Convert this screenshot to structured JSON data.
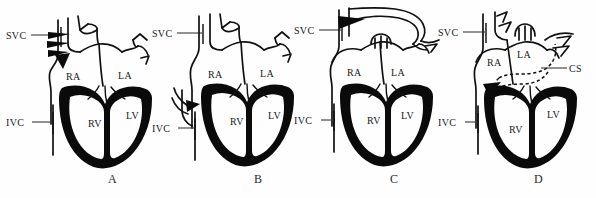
{
  "figure": {
    "type": "medical-illustration",
    "background_color": "#fefefe",
    "ink_color": "#111111",
    "panel_count": 4
  },
  "panels": [
    {
      "id": "A",
      "letter": "A",
      "labels": {
        "svc": "SVC",
        "ivc": "IVC",
        "ra": "RA",
        "la": "LA",
        "rv": "RV",
        "lv": "LV"
      },
      "features": [
        "descending-chevron-arrows-on-svc",
        "retrograde-flow-indicators"
      ]
    },
    {
      "id": "B",
      "letter": "B",
      "labels": {
        "svc": "SVC",
        "ivc": "IVC",
        "ra": "RA",
        "la": "LA",
        "rv": "RV",
        "lv": "LV"
      },
      "features": [
        "hepatic-vein-branch-arrow-into-ra",
        "ivc-junction-arrow"
      ]
    },
    {
      "id": "C",
      "letter": "C",
      "labels": {
        "svc": "SVC",
        "ivc": "IVC",
        "ra": "RA",
        "la": "LA",
        "rv": "RV",
        "lv": "LV"
      },
      "features": [
        "anomalous-arching-vessel-over-heart",
        "arrow-entering-svc-from-arch"
      ]
    },
    {
      "id": "D",
      "letter": "D",
      "labels": {
        "svc": "SVC",
        "ivc": "IVC",
        "ra": "RA",
        "la": "LA",
        "rv": "RV",
        "lv": "LV",
        "cs": "CS"
      },
      "features": [
        "dashed-coronary-sinus-channel",
        "cs-leader-line",
        "arrow-into-right-atrium"
      ]
    }
  ],
  "panel_letters": [
    "A",
    "B",
    "C",
    "D"
  ]
}
